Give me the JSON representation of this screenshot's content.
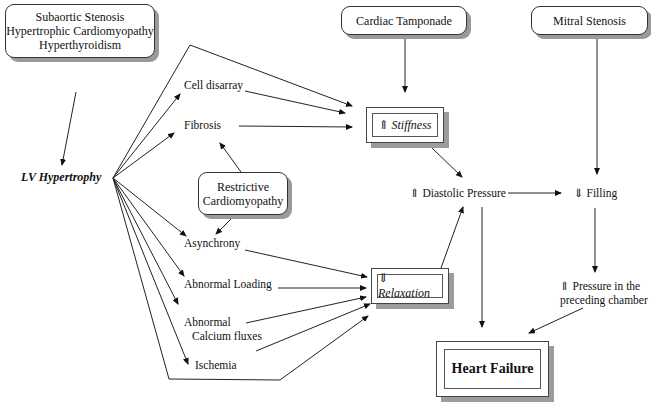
{
  "causes": {
    "lv_causes": [
      "Subaortic Stenosis",
      "Hypertrophic Cardiomyopathy",
      "Hyperthyroidism"
    ],
    "tamponade": "Cardiac Tamponade",
    "mitral": "Mitral Stenosis",
    "restrictive": [
      "Restrictive",
      "Cardiomyopathy"
    ]
  },
  "nodes": {
    "lv_hypertrophy": "LV Hypertrophy",
    "cell_disarray": "Cell disarray",
    "fibrosis": "Fibrosis",
    "asynchrony": "Asynchrony",
    "abnormal_loading": "Abnormal Loading",
    "calcium_1": "Abnormal",
    "calcium_2": "Calcium fluxes",
    "ischemia": "Ischemia",
    "stiffness": "⇑ Stiffness",
    "relaxation": "⇓ Relaxation",
    "diastolic_pressure": "⇑ Diastolic Pressure",
    "filling": "⇓ Filling",
    "preceding_1": "⇑ Pressure in the",
    "preceding_2": "preceding chamber",
    "heart_failure": "Heart Failure"
  }
}
